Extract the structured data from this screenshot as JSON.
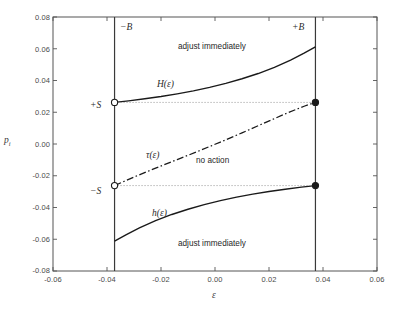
{
  "chart_data": {
    "type": "line",
    "title": "",
    "xlabel": "ε",
    "ylabel": "p",
    "ylabel_sub": "i",
    "xlim": [
      -0.06,
      0.06
    ],
    "ylim": [
      -0.08,
      0.08
    ],
    "xticks": [
      "-0.06",
      "-0.04",
      "-0.02",
      "0.00",
      "0.02",
      "0.04",
      "0.06"
    ],
    "xtick_values": [
      -0.06,
      -0.04,
      -0.02,
      0.0,
      0.02,
      0.04,
      0.06
    ],
    "yticks": [
      "-0.08",
      "-0.06",
      "-0.04",
      "-0.02",
      "0.00",
      "0.02",
      "0.04",
      "0.06",
      "0.08"
    ],
    "ytick_values": [
      -0.08,
      -0.06,
      -0.04,
      -0.02,
      0.0,
      0.02,
      0.04,
      0.06,
      0.08
    ],
    "grid": false,
    "legend_position": "none",
    "boundaries": {
      "minus_B": -0.0372,
      "plus_B": 0.0372,
      "plus_S": 0.0262,
      "minus_S": -0.0262
    },
    "series": [
      {
        "name": "H(ε)",
        "style": "solid",
        "x": [
          -0.0372,
          -0.032,
          -0.026,
          -0.02,
          -0.014,
          -0.008,
          -0.002,
          0.004,
          0.01,
          0.016,
          0.022,
          0.028,
          0.033,
          0.0372
        ],
        "y": [
          0.0262,
          0.0272,
          0.0285,
          0.0299,
          0.0316,
          0.0335,
          0.0357,
          0.0382,
          0.0411,
          0.0444,
          0.0483,
          0.0528,
          0.0572,
          0.0612
        ]
      },
      {
        "name": "h(ε)",
        "style": "solid",
        "x": [
          -0.0372,
          -0.033,
          -0.028,
          -0.022,
          -0.016,
          -0.01,
          -0.004,
          0.002,
          0.008,
          0.014,
          0.02,
          0.026,
          0.032,
          0.0372
        ],
        "y": [
          -0.0612,
          -0.0572,
          -0.0528,
          -0.0483,
          -0.0444,
          -0.0411,
          -0.0382,
          -0.0357,
          -0.0335,
          -0.0316,
          -0.0299,
          -0.0285,
          -0.0272,
          -0.0262
        ]
      },
      {
        "name": "τ(ε)",
        "style": "dash-dot",
        "x": [
          -0.0372,
          -0.03,
          -0.022,
          -0.014,
          -0.006,
          0.002,
          0.01,
          0.018,
          0.026,
          0.033,
          0.0372
        ],
        "y": [
          -0.0262,
          -0.0208,
          -0.0152,
          -0.0098,
          -0.0044,
          0.0012,
          0.007,
          0.013,
          0.019,
          0.0238,
          0.0262
        ]
      },
      {
        "name": "+S level",
        "style": "dotted",
        "x": [
          -0.0372,
          0.0372
        ],
        "y": [
          0.0262,
          0.0262
        ]
      },
      {
        "name": "-S level",
        "style": "dotted",
        "x": [
          -0.0372,
          0.0372
        ],
        "y": [
          -0.0262,
          -0.0262
        ]
      }
    ],
    "markers": [
      {
        "label": "+S left",
        "x": -0.0372,
        "y": 0.0262,
        "fill": "open"
      },
      {
        "label": "+S right",
        "x": 0.0372,
        "y": 0.0262,
        "fill": "filled"
      },
      {
        "label": "-S left",
        "x": -0.0372,
        "y": -0.0262,
        "fill": "open"
      },
      {
        "label": "-S right",
        "x": 0.0372,
        "y": -0.0262,
        "fill": "filled"
      }
    ],
    "annotations": [
      {
        "id": "minus-B",
        "text": "−B",
        "x": -0.0337,
        "y": 0.0715,
        "kind": "math"
      },
      {
        "id": "plus-B",
        "text": "+B",
        "x": 0.03,
        "y": 0.0715,
        "kind": "math"
      },
      {
        "id": "adjust-top",
        "text": "adjust immediately",
        "x": 0.001,
        "y": 0.06,
        "kind": "plain"
      },
      {
        "id": "adjust-bottom",
        "text": "adjust immediately",
        "x": 0.001,
        "y": -0.061,
        "kind": "plain"
      },
      {
        "id": "H-label",
        "text": "H(ε)",
        "x": -0.016,
        "y": 0.037,
        "kind": "math"
      },
      {
        "id": "h-label",
        "text": "h(ε)",
        "x": -0.0175,
        "y": -0.038,
        "kind": "math"
      },
      {
        "id": "tau-label",
        "text": "τ(ε)",
        "x": -0.02,
        "y": -0.0055,
        "kind": "math"
      },
      {
        "id": "no-action",
        "text": "no action",
        "x": 0.001,
        "y": -0.0095,
        "kind": "plain"
      },
      {
        "id": "plus-S",
        "text": "+S",
        "x": -0.0435,
        "y": 0.0262,
        "kind": "math"
      },
      {
        "id": "minus-S",
        "text": "−S",
        "x": -0.0435,
        "y": -0.0262,
        "kind": "math"
      }
    ],
    "colors": {
      "axis": "#555555",
      "curve": "#1a1a1a",
      "dotted": "#8a8a8a",
      "boundary_line": "#3a3a3a",
      "text": "#333333"
    }
  },
  "labels": {
    "y_axis": "p",
    "y_axis_sub": "i",
    "x_axis": "ε",
    "ytick_0": "0.08",
    "ytick_1": "0.06",
    "ytick_2": "0.04",
    "ytick_3": "0.02",
    "ytick_4": "0.00",
    "ytick_5": "-0.02",
    "ytick_6": "-0.04",
    "ytick_7": "-0.06",
    "ytick_8": "-0.08",
    "xtick_0": "-0.06",
    "xtick_1": "-0.04",
    "xtick_2": "-0.02",
    "xtick_3": "0.00",
    "xtick_4": "0.02",
    "xtick_5": "0.04",
    "xtick_6": "0.06",
    "minus_B": "−B",
    "plus_B": "+B",
    "plus_S": "+S",
    "minus_S": "−S",
    "adjust_top": "adjust immediately",
    "adjust_bottom": "adjust immediately",
    "no_action": "no action",
    "H_fn": "H(ε)",
    "h_fn": "h(ε)",
    "tau_fn": "τ(ε)"
  }
}
